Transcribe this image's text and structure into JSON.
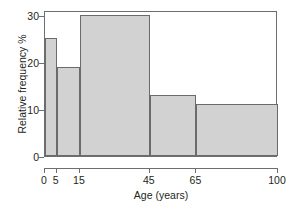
{
  "chart_data": {
    "type": "bar",
    "title": "",
    "subtitle": "",
    "xlabel": "Age (years)",
    "ylabel": "Relative frequency %",
    "xlim": [
      0,
      100
    ],
    "ylim": [
      0,
      31
    ],
    "grid": false,
    "legend": null,
    "histogram": true,
    "bin_edges": [
      0,
      5,
      15,
      45,
      65,
      100
    ],
    "categories": [
      "0-5",
      "5-15",
      "15-45",
      "45-65",
      "65-100"
    ],
    "values": [
      25,
      19,
      30,
      13,
      11
    ],
    "bars": [
      {
        "label": "0-5",
        "x0": 0,
        "x1": 5,
        "value": 25
      },
      {
        "label": "5-15",
        "x0": 5,
        "x1": 15,
        "value": 19
      },
      {
        "label": "15-45",
        "x0": 15,
        "x1": 45,
        "value": 30
      },
      {
        "label": "45-65",
        "x0": 45,
        "x1": 65,
        "value": 13
      },
      {
        "label": "65-100",
        "x0": 65,
        "x1": 100,
        "value": 11
      }
    ],
    "xticks": [
      0,
      5,
      15,
      45,
      65,
      100
    ],
    "xticklabels": [
      "0",
      "5",
      "15",
      "45",
      "65",
      "100"
    ],
    "yticks": [
      0,
      10,
      20,
      30
    ],
    "yticklabels": [
      "0",
      "10",
      "20",
      "30"
    ],
    "colors": {
      "bar_fill": "#d2d2d2",
      "bar_edge": "#6b6b6b",
      "axis": "#6e6e6e",
      "text": "#231f20",
      "background": "#ffffff"
    }
  }
}
